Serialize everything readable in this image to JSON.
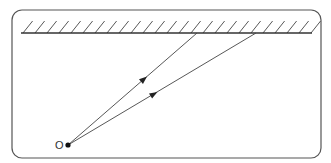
{
  "diagram": {
    "type": "plane-mirror-reflection",
    "frame": {
      "x": 12,
      "y": 10,
      "width": 309,
      "height": 148,
      "radius": 10
    },
    "mirror": {
      "label": "mirror",
      "x1": 21,
      "y1": 33,
      "x2": 312,
      "y2": 33,
      "hatch_count": 25,
      "hatch_spacing": 12,
      "hatch_height": 12
    },
    "point": {
      "label": "O",
      "x": 68,
      "y": 145
    },
    "rays": [
      {
        "name": "ray-1",
        "from": {
          "x": 68,
          "y": 145
        },
        "to": {
          "x": 197,
          "y": 33
        },
        "arrow_at": {
          "x": 144,
          "y": 79
        }
      },
      {
        "name": "ray-2",
        "from": {
          "x": 68,
          "y": 145
        },
        "to": {
          "x": 256,
          "y": 33
        },
        "arrow_at": {
          "x": 154,
          "y": 94
        }
      }
    ],
    "colors": {
      "line": "#444444",
      "point": "#111111",
      "frame": "#555555"
    }
  }
}
